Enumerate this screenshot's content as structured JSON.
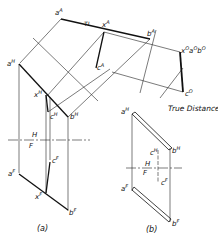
{
  "figure": {
    "caption_a": "(a)",
    "caption_b": "(b)",
    "callout": "True Distance",
    "tl_top": "TL",
    "tl_right": "TL"
  },
  "labels": {
    "aA": "a",
    "aA_sup": "A",
    "xA": "x",
    "xA_sup": "A",
    "bA": "b",
    "bA_sup": "A",
    "cA": "c",
    "cA_sup": "A",
    "xO": "x",
    "xO_sup": "O",
    "aO": "a",
    "aO_sup": "O",
    "bO": "b",
    "bO_sup": "O",
    "cO": "c",
    "cO_sup": "O",
    "aH": "a",
    "aH_sup": "H",
    "xH": "x",
    "xH_sup": "H",
    "cH": "c",
    "cH_sup": "H",
    "bH": "b",
    "bH_sup": "H",
    "aF": "a",
    "aF_sup": "F",
    "cF": "c",
    "cF_sup": "F",
    "xF": "x",
    "xF_sup": "F",
    "bF": "b",
    "bF_sup": "F",
    "b_aH": "a",
    "b_aH_sup": "H",
    "b_cH": "c",
    "b_cH_sup": "H",
    "b_bH": "b",
    "b_bH_sup": "H",
    "b_aF": "a",
    "b_aF_sup": "F",
    "b_cF": "c",
    "b_cF_sup": "F",
    "b_bF": "b",
    "b_bF_sup": "F"
  },
  "fold_lines": {
    "HA_top": "A",
    "HA_bottom": "H",
    "AO_left": "A",
    "AO_right": "O",
    "HF_a_top": "H",
    "HF_a_bottom": "F",
    "HF_b_top": "H",
    "HF_b_bottom": "F"
  }
}
